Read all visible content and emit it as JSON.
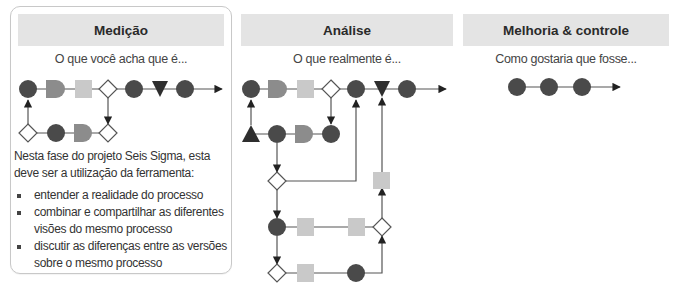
{
  "panels": [
    {
      "id": "medicao",
      "title": "Medição",
      "subtitle": "O que você acha que é...",
      "description": {
        "intro": "Nesta fase do projeto Seis Sigma, esta deve ser a utilização da ferramenta:",
        "bullets": [
          "entender a realidade do processo",
          "combinar e compartilhar as diferentes visões do mesmo processo",
          "discutir as diferenças entre as versões sobre o mesmo processo"
        ]
      }
    },
    {
      "id": "analise",
      "title": "Análise",
      "subtitle": "O que realmente é..."
    },
    {
      "id": "melhoria",
      "title": "Melhoria & controle",
      "subtitle": "Como gostaria que fosse..."
    }
  ],
  "legend_symbols": {
    "operation": "dark-circle",
    "delay": "d-shape",
    "transport": "light-square",
    "decision": "white-diamond",
    "storage": "inverted-triangle",
    "inspection": "triangle"
  },
  "colors": {
    "dark_shape": "#4a4a4a",
    "mid_shape": "#8c8c8c",
    "light_shape": "#c9c9c9",
    "header_bg": "#e4e4e4",
    "line": "#555555",
    "panel_border": "#c8c8c8"
  }
}
